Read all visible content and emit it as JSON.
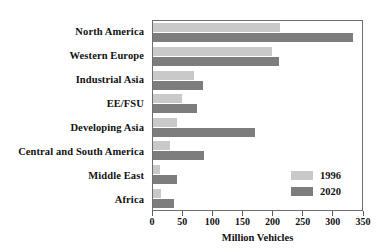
{
  "chart_data": {
    "type": "bar",
    "orientation": "horizontal",
    "title": "",
    "xlabel": "Million Vehicles",
    "ylabel": "",
    "xlim": [
      0,
      350
    ],
    "xticks": [
      0,
      50,
      100,
      150,
      200,
      250,
      300,
      350
    ],
    "grid": false,
    "legend_position": "inside-bottom-right",
    "categories": [
      "North America",
      "Western Europe",
      "Industrial Asia",
      "EE/FSU",
      "Developing Asia",
      "Central and South America",
      "Middle East",
      "Africa"
    ],
    "series": [
      {
        "name": "1996",
        "color": "#c9c9c9",
        "values": [
          212,
          200,
          68,
          49,
          41,
          28,
          12,
          14
        ]
      },
      {
        "name": "2020",
        "color": "#7d7d7d",
        "values": [
          335,
          211,
          83,
          73,
          170,
          86,
          41,
          36
        ]
      }
    ]
  },
  "axis": {
    "tick_labels": [
      "0",
      "50",
      "100",
      "150",
      "200",
      "250",
      "300",
      "350"
    ],
    "x_title": "Million Vehicles"
  },
  "legend": {
    "entries": [
      {
        "label": "1996",
        "swatch": "light"
      },
      {
        "label": "2020",
        "swatch": "dark"
      }
    ]
  }
}
